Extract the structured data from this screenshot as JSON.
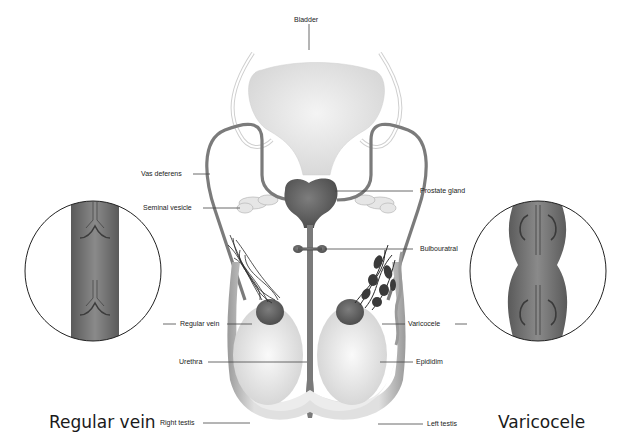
{
  "diagram": {
    "labels": {
      "bladder": "Bladder",
      "vas_deferens": "Vas deferens",
      "seminal_vesicle": "Seminal vesicle",
      "prostate_gland": "Prostate gland",
      "bulbouratral": "Bulbouratral",
      "regular_vein": "Regular vein",
      "varicocele": "Varicocele",
      "urethra": "Urethra",
      "epididim": "Epididim",
      "right_testis": "Right testis",
      "left_testis": "Left testis"
    },
    "insets": {
      "left": {
        "caption": "Regular vein"
      },
      "right": {
        "caption": "Varicocele"
      }
    },
    "colors": {
      "background": "#ffffff",
      "organ_dark": "#6e6e6e",
      "organ_light": "#e4e4e4",
      "outline": "#333333",
      "leader_line": "#444444"
    }
  }
}
